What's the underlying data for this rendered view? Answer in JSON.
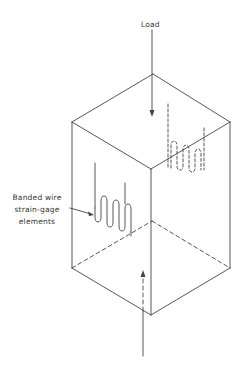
{
  "diagram": {
    "labels": {
      "load": "Load",
      "gage_line1": "Banded wire",
      "gage_line2": "strain-gage",
      "gage_line3": "elements"
    },
    "colors": {
      "line": "#444444",
      "text": "#333333",
      "background": "#ffffff"
    }
  }
}
